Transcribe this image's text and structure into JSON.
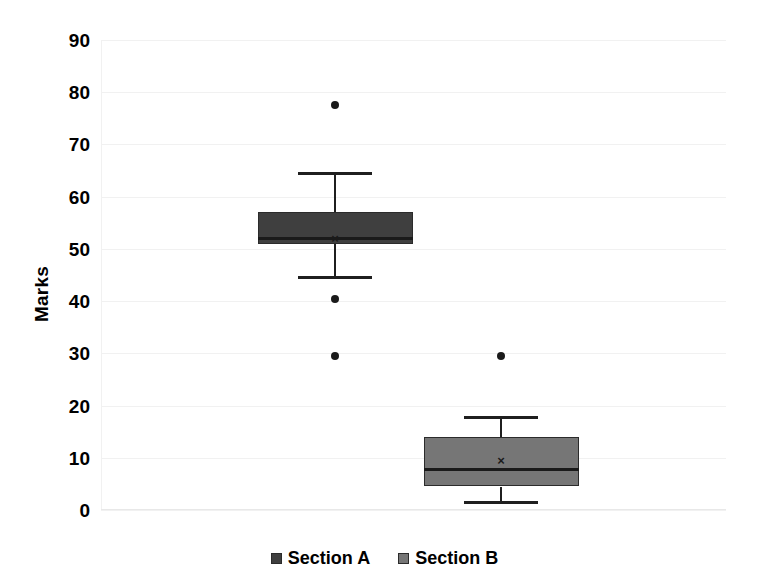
{
  "chart_data": {
    "type": "box",
    "title": "",
    "xlabel": "",
    "ylabel": "Marks",
    "ylim": [
      0,
      90
    ],
    "ytick_step": 10,
    "yticks": [
      "90",
      "80",
      "70",
      "60",
      "50",
      "40",
      "30",
      "20",
      "10",
      "0"
    ],
    "grid": true,
    "legend_position": "bottom",
    "categories": [
      "Section A",
      "Section B"
    ],
    "series": [
      {
        "name": "Section A",
        "color": "#3f3f3f",
        "min_whisker": 44.5,
        "q1": 51.0,
        "median": 52.0,
        "q3": 57.0,
        "max_whisker": 64.5,
        "mean": 52.0,
        "outliers": [
          77.5,
          40.5,
          29.5
        ]
      },
      {
        "name": "Section B",
        "color": "#767676",
        "min_whisker": 1.5,
        "q1": 4.5,
        "median": 7.8,
        "q3": 14.0,
        "max_whisker": 17.8,
        "mean": 9.5,
        "outliers": [
          29.5
        ]
      }
    ]
  },
  "legend": {
    "items": [
      {
        "label": "Section A",
        "color": "#3f3f3f"
      },
      {
        "label": "Section B",
        "color": "#767676"
      }
    ]
  },
  "axis": {
    "y_title": "Marks"
  },
  "marks": {
    "mean_glyph": "×"
  }
}
